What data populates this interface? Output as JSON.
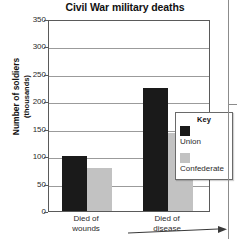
{
  "chart_data": {
    "type": "bar",
    "title": "Civil War military deaths",
    "xlabel": "",
    "ylabel": "Number of soldiers",
    "ylabel_sub": "(thousands)",
    "categories": [
      "Died of wounds",
      "Died of disease"
    ],
    "category_lines": [
      [
        "Died of",
        "wounds"
      ],
      [
        "Died of",
        "disease"
      ]
    ],
    "series": [
      {
        "name": "Union",
        "color": "#1a1a1a",
        "values": [
          100,
          225
        ]
      },
      {
        "name": "Confederate",
        "color": "#c2c2c2",
        "values": [
          78,
          143
        ]
      }
    ],
    "ylim": [
      0,
      350
    ],
    "ytick_values": [
      0,
      50,
      100,
      150,
      200,
      250,
      300,
      350
    ],
    "ytick_labels": [
      "0",
      "50",
      "100",
      "150",
      "200",
      "250",
      "300",
      "350"
    ],
    "grid": true,
    "legend_position": "inside-right",
    "legend_title": "Key"
  },
  "figure": {
    "background_color": "#ffffff",
    "frame_color": "#5a5a5a",
    "grid_color": "#9b9b9b"
  }
}
